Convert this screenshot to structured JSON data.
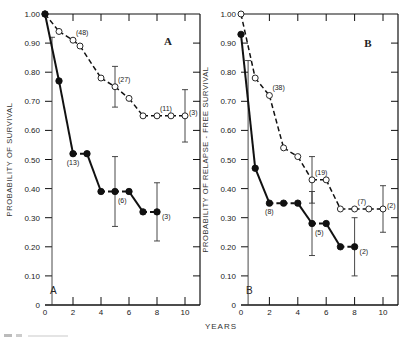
{
  "chart_data": [
    {
      "type": "line",
      "panel": "A",
      "title": "A",
      "corner_label": "A",
      "xlabel": "YEARS",
      "ylabel": "PROBABILITY OF SURVIVAL",
      "xlim": [
        0,
        11
      ],
      "ylim": [
        0,
        1.0
      ],
      "x_ticks": [
        0,
        2,
        4,
        6,
        8,
        10
      ],
      "y_ticks": [
        0,
        0.1,
        0.2,
        0.3,
        0.4,
        0.5,
        0.6,
        0.7,
        0.8,
        0.9,
        1.0
      ],
      "y_tick_labels": [
        "0",
        "0.10",
        "0.20",
        "0.30",
        "0.40",
        "0.50",
        "0.60",
        "0.70",
        "0.80",
        "0.90",
        "1.00"
      ],
      "series": [
        {
          "name": "open",
          "marker": "open-circle",
          "style": "dashed",
          "x": [
            0,
            1,
            2,
            2.5,
            4,
            5,
            6,
            7,
            8,
            9,
            10
          ],
          "y": [
            1.0,
            0.94,
            0.91,
            0.89,
            0.78,
            0.75,
            0.71,
            0.65,
            0.65,
            0.65,
            0.65
          ],
          "error_bars": [
            {
              "x": 5,
              "low": 0.68,
              "high": 0.82
            },
            {
              "x": 10,
              "low": 0.56,
              "high": 0.74
            }
          ],
          "annotations": [
            {
              "x": 2,
              "y": 0.91,
              "text": "(48)"
            },
            {
              "x": 5,
              "y": 0.75,
              "text": "(27)"
            },
            {
              "x": 8,
              "y": 0.65,
              "text": "(11)"
            },
            {
              "x": 10,
              "y": 0.65,
              "text": "(3)"
            }
          ]
        },
        {
          "name": "filled",
          "marker": "filled-circle",
          "style": "solid-dashed",
          "x": [
            0,
            1,
            2,
            3,
            4,
            5,
            6,
            7,
            8
          ],
          "y": [
            1.0,
            0.77,
            0.52,
            0.52,
            0.39,
            0.39,
            0.39,
            0.32,
            0.32
          ],
          "error_bars": [
            {
              "x": 0.5,
              "low": 0.0,
              "high": 0.92
            },
            {
              "x": 5,
              "low": 0.27,
              "high": 0.51
            },
            {
              "x": 8,
              "low": 0.22,
              "high": 0.42
            }
          ],
          "annotations": [
            {
              "x": 2,
              "y": 0.52,
              "text": "(13)"
            },
            {
              "x": 5,
              "y": 0.39,
              "text": "(6)"
            },
            {
              "x": 8,
              "y": 0.32,
              "text": "(3)"
            }
          ]
        }
      ]
    },
    {
      "type": "line",
      "panel": "B",
      "title": "B",
      "corner_label": "B",
      "xlabel": "YEARS",
      "ylabel": "PROBABILITY OF RELAPSE - FREE SURVIVAL",
      "xlim": [
        0,
        11
      ],
      "ylim": [
        0,
        1.0
      ],
      "x_ticks": [
        0,
        2,
        4,
        6,
        8,
        10
      ],
      "y_ticks": [
        0,
        0.1,
        0.2,
        0.3,
        0.4,
        0.5,
        0.6,
        0.7,
        0.8,
        0.9,
        1.0
      ],
      "y_tick_labels": [
        "0",
        "0.10",
        "0.20",
        "0.30",
        "0.40",
        "0.50",
        "0.60",
        "0.70",
        "0.80",
        "0.90",
        "1.00"
      ],
      "series": [
        {
          "name": "open",
          "marker": "open-circle",
          "style": "dashed",
          "x": [
            0,
            1,
            2,
            3,
            4,
            5,
            6,
            7,
            8,
            9,
            10
          ],
          "y": [
            1.0,
            0.78,
            0.72,
            0.54,
            0.51,
            0.43,
            0.43,
            0.33,
            0.33,
            0.33,
            0.33
          ],
          "error_bars": [
            {
              "x": 5,
              "low": 0.35,
              "high": 0.51
            },
            {
              "x": 10,
              "low": 0.25,
              "high": 0.41
            }
          ],
          "annotations": [
            {
              "x": 2,
              "y": 0.72,
              "text": "(38)"
            },
            {
              "x": 5,
              "y": 0.43,
              "text": "(19)"
            },
            {
              "x": 8,
              "y": 0.33,
              "text": "(7)"
            },
            {
              "x": 10,
              "y": 0.33,
              "text": "(2)"
            }
          ]
        },
        {
          "name": "filled",
          "marker": "filled-circle",
          "style": "solid-dashed",
          "x": [
            0,
            1,
            2,
            3,
            4,
            5,
            6,
            7,
            8
          ],
          "y": [
            0.93,
            0.47,
            0.35,
            0.35,
            0.35,
            0.28,
            0.28,
            0.2,
            0.2
          ],
          "error_bars": [
            {
              "x": 0.5,
              "low": 0.0,
              "high": 0.84
            },
            {
              "x": 5,
              "low": 0.17,
              "high": 0.39
            },
            {
              "x": 8,
              "low": 0.1,
              "high": 0.3
            }
          ],
          "annotations": [
            {
              "x": 2,
              "y": 0.35,
              "text": "(8)"
            },
            {
              "x": 5,
              "y": 0.28,
              "text": "(5)"
            },
            {
              "x": 8,
              "y": 0.2,
              "text": "(2)"
            }
          ]
        }
      ]
    }
  ],
  "shared_xlabel": "YEARS"
}
